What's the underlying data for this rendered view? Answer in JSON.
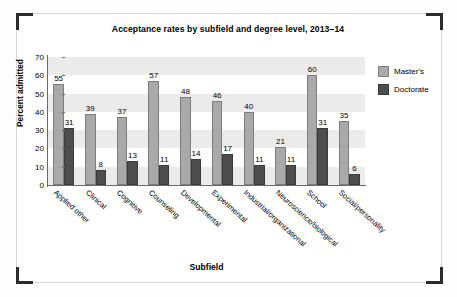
{
  "chart_data": {
    "type": "bar",
    "title": "Acceptance rates by subfield and degree level, 2013–14",
    "xlabel": "Subfield",
    "ylabel": "Percent admitted",
    "ylim": [
      0,
      70
    ],
    "yticks": [
      0,
      10,
      20,
      30,
      40,
      50,
      60,
      70
    ],
    "grid": "horizontal-banding",
    "legend_position": "right",
    "categories": [
      "Applied other",
      "Clinical",
      "Cognitive",
      "Counseling",
      "Developmental",
      "Experimental",
      "Industrial/organizational",
      "Neuroscience/biological",
      "School",
      "Social/personality"
    ],
    "series": [
      {
        "name": "Master's",
        "color": "#a9a9a9",
        "values": [
          55,
          39,
          37,
          57,
          48,
          46,
          40,
          21,
          60,
          35
        ]
      },
      {
        "name": "Doctorate",
        "color": "#4d4d4d",
        "values": [
          31,
          8,
          13,
          11,
          14,
          17,
          11,
          11,
          31,
          6
        ]
      }
    ]
  }
}
